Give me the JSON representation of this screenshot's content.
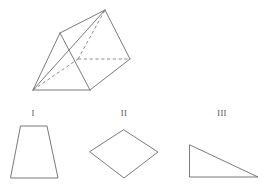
{
  "figure": {
    "stroke_color": "#6a6a70",
    "dashed_stroke_color": "#77777e",
    "background_color": "#ffffff"
  },
  "prism": {
    "name": "triangular-prism",
    "description": "Oblique triangular prism drawn with solid visible edges and dashed hidden edges",
    "vertices": {
      "back_top_apex": [
        105,
        10
      ],
      "front_top_apex": [
        60,
        33
      ],
      "right_mid": [
        130,
        59
      ],
      "hidden_mid": [
        78,
        59
      ],
      "front_bottom_left": [
        33,
        90
      ],
      "front_bottom_right": [
        90,
        90
      ]
    },
    "solid_edges": [
      [
        [
          60,
          33
        ],
        [
          105,
          10
        ]
      ],
      [
        [
          105,
          10
        ],
        [
          130,
          59
        ]
      ],
      [
        [
          60,
          33
        ],
        [
          33,
          90
        ]
      ],
      [
        [
          33,
          90
        ],
        [
          90,
          90
        ]
      ],
      [
        [
          90,
          90
        ],
        [
          130,
          59
        ]
      ],
      [
        [
          60,
          33
        ],
        [
          90,
          90
        ]
      ],
      [
        [
          33,
          90
        ],
        [
          105,
          10
        ]
      ]
    ],
    "dashed_edges": [
      [
        [
          33,
          90
        ],
        [
          78,
          59
        ]
      ],
      [
        [
          78,
          59
        ],
        [
          130,
          59
        ]
      ],
      [
        [
          78,
          59
        ],
        [
          105,
          10
        ]
      ]
    ]
  },
  "cross_sections": [
    {
      "label": "I",
      "name": "trapezoid",
      "label_position": [
        33,
        109
      ],
      "points": "21,126 47,126 58,178 11,178"
    },
    {
      "label": "II",
      "name": "rhombus",
      "label_position": [
        124,
        109
      ],
      "points": "124,130 158,152 124,178 90,152"
    },
    {
      "label": "III",
      "name": "right-triangle",
      "label_position": [
        222,
        109
      ],
      "points": "190,145 258,177 190,177"
    }
  ]
}
